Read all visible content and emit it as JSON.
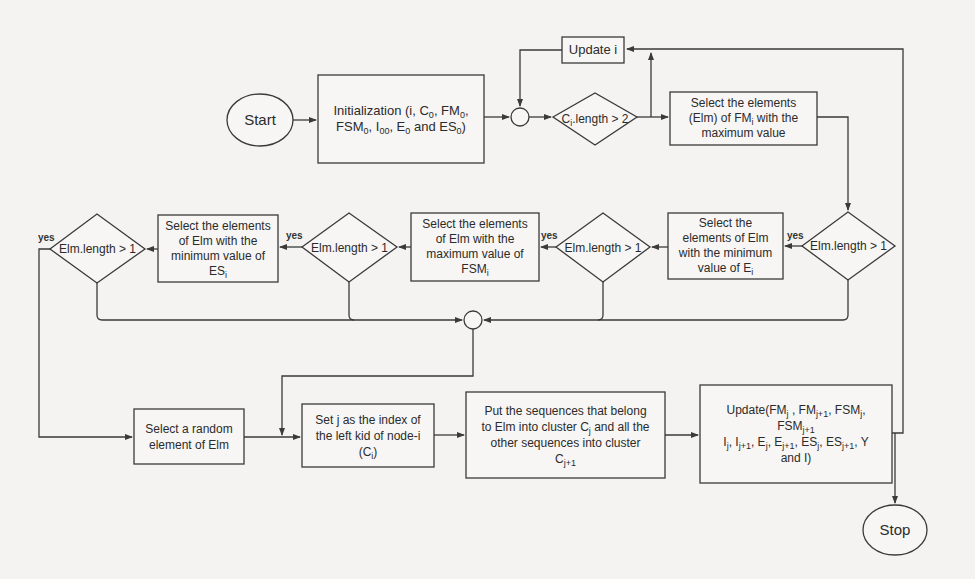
{
  "diagram": {
    "type": "flowchart",
    "nodes": {
      "start": {
        "label": "Start"
      },
      "init": {
        "label_parts": [
          "Initialization (i, C",
          "0",
          ", FM",
          "0",
          ", FSM",
          "0",
          ", I",
          "00",
          ", E",
          "0",
          " and ES",
          "0",
          ")"
        ]
      },
      "update_i": {
        "label": "Update i"
      },
      "cond_ci": {
        "label_main": "C",
        "label_sub": "i",
        "label_rest": ".length > 2"
      },
      "select_fm": {
        "line1": "Select the elements",
        "line2a": "(Elm) of FM",
        "line2sub": "i",
        "line2b": " with the",
        "line3": "maximum value"
      },
      "cond1": {
        "label": "Elm.length > 1"
      },
      "select_e": {
        "line1": "Select the",
        "line2": "elements of Elm",
        "line3": "with the minimum",
        "line4a": "value of E",
        "line4sub": "i"
      },
      "cond2": {
        "label": "Elm.length > 1"
      },
      "select_fsm": {
        "line1": "Select the elements",
        "line2": "of Elm with the",
        "line3": "maximum value of",
        "line4a": "FSM",
        "line4sub": "i"
      },
      "cond3": {
        "label": "Elm.length > 1"
      },
      "select_es": {
        "line1": "Select the elements",
        "line2": "of Elm with the",
        "line3": "minimum value of",
        "line4a": "ES",
        "line4sub": "i"
      },
      "cond4": {
        "label": "Elm.length > 1"
      },
      "select_random": {
        "line1": "Select a random",
        "line2": "element of Elm"
      },
      "set_j": {
        "line1": "Set j as the index of",
        "line2": "the left kid of node-i",
        "line3a": "(C",
        "line3sub": "i",
        "line3b": ")"
      },
      "put_seq": {
        "line1": "Put the sequences that belong",
        "line2a": "to Elm into cluster C",
        "line2sub": "j",
        "line2b": " and all the",
        "line3": "other sequences into cluster",
        "line4a": "C",
        "line4sub": "j+1"
      },
      "update_all": {
        "line1": [
          "Update(FM",
          "j",
          " , FM",
          "j+1",
          ", FSM",
          "j",
          ","
        ],
        "line2": [
          "FSM",
          "j+1"
        ],
        "line3": [
          "I",
          "j",
          ", I",
          "j+1",
          ", E",
          "j",
          ", E",
          "j+1",
          ", ES",
          "j",
          ", ES",
          "j+1",
          ", Y"
        ],
        "line4": "and I)"
      },
      "stop": {
        "label": "Stop"
      }
    },
    "edge_labels": {
      "yes": "yes"
    },
    "colors": {
      "stroke": "#3a3a3a",
      "background": "#f4f3f1",
      "text": "#2b2b2b"
    }
  }
}
